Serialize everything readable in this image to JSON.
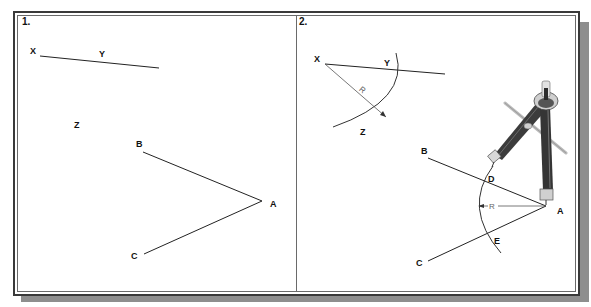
{
  "figure": {
    "type": "geometric-construction",
    "panels": [
      {
        "number_label": "1.",
        "labels": {
          "x": "X",
          "y": "Y",
          "z": "Z",
          "a": "A",
          "b": "B",
          "c": "C"
        }
      },
      {
        "number_label": "2.",
        "labels": {
          "x": "X",
          "y": "Y",
          "z": "Z",
          "a": "A",
          "b": "B",
          "c": "C",
          "d": "D",
          "e": "E",
          "radius_1": "R",
          "radius_2": "R"
        },
        "illustration": "drawing-compass"
      }
    ]
  },
  "colors": {
    "frame": "#3a3a3a",
    "shadow": "#8e8e8e",
    "line": "#222222",
    "compass_dark": "#3c3c3c",
    "compass_light": "#d8d8d8"
  }
}
